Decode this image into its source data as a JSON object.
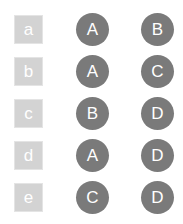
{
  "colors": {
    "square": "#d3d3d3",
    "circle": "#7a7a7a",
    "text": "#ffffff"
  },
  "rows": [
    {
      "label": "a",
      "first": "A",
      "second": "B"
    },
    {
      "label": "b",
      "first": "A",
      "second": "C"
    },
    {
      "label": "c",
      "first": "B",
      "second": "D"
    },
    {
      "label": "d",
      "first": "A",
      "second": "D"
    },
    {
      "label": "e",
      "first": "C",
      "second": "D"
    }
  ]
}
